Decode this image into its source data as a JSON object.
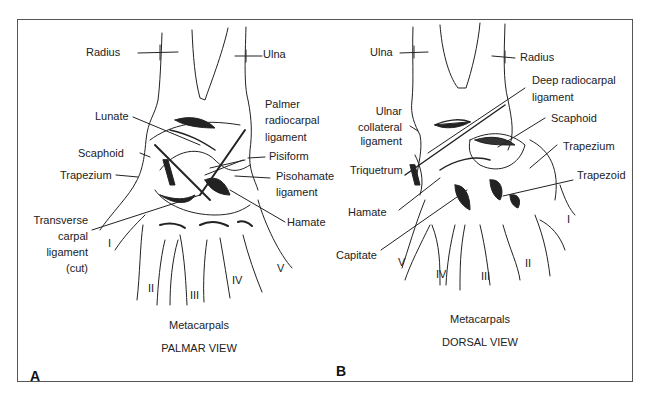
{
  "figure": {
    "panels": [
      {
        "letter": "A",
        "view_title": "PALMAR VIEW",
        "group_label": "Metacarpals",
        "labels": {
          "radius": "Radius",
          "ulna": "Ulna",
          "lunate": "Lunate",
          "palmer_radiocarpal_1": "Palmer",
          "palmer_radiocarpal_2": "radiocarpal",
          "palmer_radiocarpal_3": "ligament",
          "scaphoid": "Scaphoid",
          "pisiform": "Pisiform",
          "trapezium": "Trapezium",
          "pisohamate_1": "Pisohamate",
          "pisohamate_2": "ligament",
          "transverse_1": "Transverse",
          "transverse_2": "carpal",
          "transverse_3": "ligament",
          "transverse_4": "(cut)",
          "hamate": "Hamate"
        },
        "metacarpal_numerals": [
          "I",
          "II",
          "III",
          "IV",
          "V"
        ]
      },
      {
        "letter": "B",
        "view_title": "DORSAL VIEW",
        "group_label": "Metacarpals",
        "labels": {
          "ulna": "Ulna",
          "radius": "Radius",
          "deep_radiocarpal_1": "Deep radiocarpal",
          "deep_radiocarpal_2": "ligament",
          "ulnar_collateral_1": "Ulnar",
          "ulnar_collateral_2": "collateral",
          "ulnar_collateral_3": "ligament",
          "scaphoid": "Scaphoid",
          "trapezium": "Trapezium",
          "triquetrum": "Triquetrum",
          "trapezoid": "Trapezoid",
          "hamate": "Hamate",
          "capitate": "Capitate"
        },
        "metacarpal_numerals": [
          "V",
          "IV",
          "III",
          "II",
          "I"
        ]
      }
    ]
  }
}
